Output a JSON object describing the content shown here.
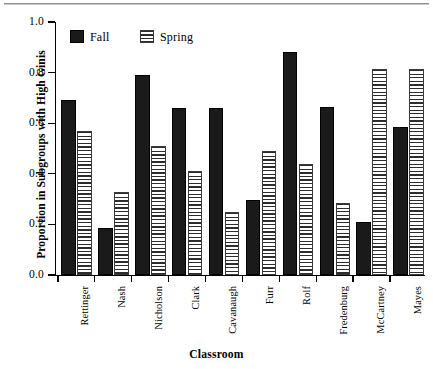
{
  "chart_data": {
    "type": "bar",
    "title": "",
    "xlabel": "Classroom",
    "ylabel": "Proportion in Subgroups with High Ginis",
    "ylim": [
      0,
      1.0
    ],
    "yticks": [
      "0.0",
      "0.2",
      "0.4",
      "0.6",
      "0.8",
      "1.0"
    ],
    "ytick_values": [
      0.0,
      0.2,
      0.4,
      0.6,
      0.8,
      1.0
    ],
    "grid": false,
    "legend_position": "top-left-inside",
    "categories": [
      "Rettinger",
      "Nash",
      "Nicholson",
      "Clark",
      "Cavanaugh",
      "Furr",
      "Rolf",
      "Fredenburg",
      "McCartney",
      "Mayes"
    ],
    "series": [
      {
        "name": "Fall",
        "color": "#1a1a1a",
        "fill": "solid-black",
        "values": [
          0.69,
          0.185,
          0.79,
          0.66,
          0.66,
          0.295,
          0.88,
          0.665,
          0.21,
          0.585
        ]
      },
      {
        "name": "Spring",
        "color": "#ffffff",
        "fill": "horizontal-hatch",
        "values": [
          0.57,
          0.33,
          0.51,
          0.41,
          0.25,
          0.49,
          0.44,
          0.285,
          0.815,
          0.815
        ]
      }
    ]
  },
  "legend": {
    "items": [
      {
        "label": "Fall",
        "swatch": "solid-black-swatch"
      },
      {
        "label": "Spring",
        "swatch": "hatched-swatch"
      }
    ]
  },
  "axes": {
    "y_title": "Proportion in Subgroups with High Ginis",
    "x_title": "Classroom"
  }
}
